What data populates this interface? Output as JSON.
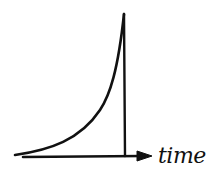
{
  "diagram": {
    "type": "hand-drawn sketch",
    "x_axis_label": "time",
    "stroke_color": "#111111",
    "background": "#ffffff"
  }
}
